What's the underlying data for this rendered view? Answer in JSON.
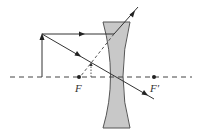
{
  "diagram": {
    "labels": {
      "focal_left": "F",
      "focal_right": "F′"
    },
    "colors": {
      "lens_fill": "#c8c8c8",
      "lens_stroke": "#555555",
      "ray": "#333333",
      "axis": "#444444"
    },
    "elements": [
      {
        "type": "optical-axis",
        "style": "dashed"
      },
      {
        "type": "object-arrow",
        "style": "solid"
      },
      {
        "type": "concave-lens"
      },
      {
        "type": "parallel-ray",
        "refracts": "diverging"
      },
      {
        "type": "central-ray",
        "passes_through": "lens center"
      },
      {
        "type": "virtual-extension",
        "style": "dashed",
        "to": "F"
      },
      {
        "type": "virtual-image",
        "style": "dotted"
      }
    ]
  }
}
